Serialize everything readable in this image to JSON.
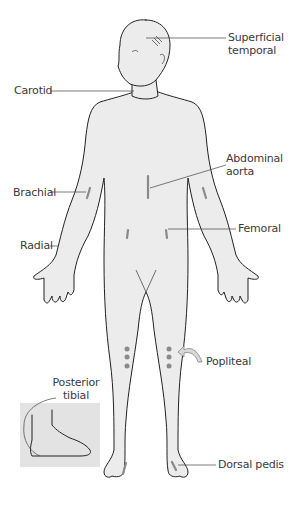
{
  "diagram": {
    "labels": {
      "superficial_temporal": [
        "Superficial",
        "temporal"
      ],
      "carotid": "Carotid",
      "abdominal_aorta": [
        "Abdominal",
        "aorta"
      ],
      "brachial": "Brachial",
      "femoral": "Femoral",
      "radial": "Radial",
      "popliteal": "Popliteal",
      "posterior_tibial": [
        "Posterior",
        "tibial"
      ],
      "dorsal_pedis": "Dorsal pedis"
    },
    "colors": {
      "body_fill": "#ececec",
      "outline": "#222222",
      "leader_line": "#444444",
      "pulse_mark": "#8a8a8a",
      "inset_bg": "#e3e3e3",
      "label_text": "#3a3a3a"
    }
  }
}
